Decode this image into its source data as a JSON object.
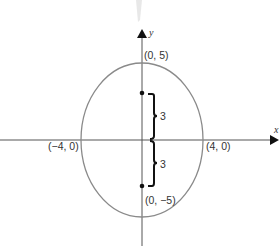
{
  "diagram": {
    "type": "ellipse-on-coordinate-axes",
    "axes": {
      "x_label": "x",
      "y_label": "y"
    },
    "ellipse": {
      "center": [
        0,
        0
      ],
      "semi_major_vertical": 5,
      "semi_minor_horizontal": 4,
      "stroke_color": "#8a8a8a"
    },
    "vertices": [
      {
        "id": "top",
        "label": "(0, 5)"
      },
      {
        "id": "bottom",
        "label": "(0, −5)"
      },
      {
        "id": "left",
        "label": "(−4, 0)"
      },
      {
        "id": "right",
        "label": "(4, 0)"
      }
    ],
    "foci": [
      {
        "id": "upper",
        "coords": [
          0,
          3
        ]
      },
      {
        "id": "lower",
        "coords": [
          0,
          -3
        ]
      }
    ],
    "braces": [
      {
        "id": "upper",
        "label": "3"
      },
      {
        "id": "lower",
        "label": "3"
      }
    ],
    "colors": {
      "axis": "#555555",
      "ellipse": "#8a8a8a",
      "brace": "#111111",
      "text": "#333333"
    }
  }
}
